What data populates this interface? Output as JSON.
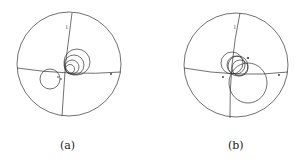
{
  "figure": {
    "panels": [
      {
        "id": "a",
        "caption": "(a)",
        "labels": {
          "top": "l",
          "right": "a",
          "center": "r"
        }
      },
      {
        "id": "b",
        "caption": "(b)",
        "labels": {
          "top": "l",
          "right": "a",
          "center": "r",
          "point": "p"
        }
      }
    ]
  },
  "colors": {
    "line": "#333333",
    "background": "#ffffff"
  }
}
